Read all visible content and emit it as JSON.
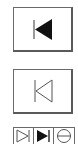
{
  "buttons": [
    {
      "id": "skip-back-filled",
      "icon": "skip-to-start-filled-icon",
      "state": "active"
    },
    {
      "id": "skip-back-outline",
      "icon": "skip-to-start-outline-icon",
      "state": "inactive"
    }
  ],
  "strip": {
    "cells": [
      {
        "icon": "skip-to-end-outline-icon"
      },
      {
        "icon": "skip-to-end-filled-icon"
      },
      {
        "icon": "circle-minus-icon"
      }
    ]
  },
  "colors": {
    "border": "#6a6a6a",
    "icon_filled": "#111111",
    "icon_stroke": "#555555",
    "background": "#ffffff"
  }
}
